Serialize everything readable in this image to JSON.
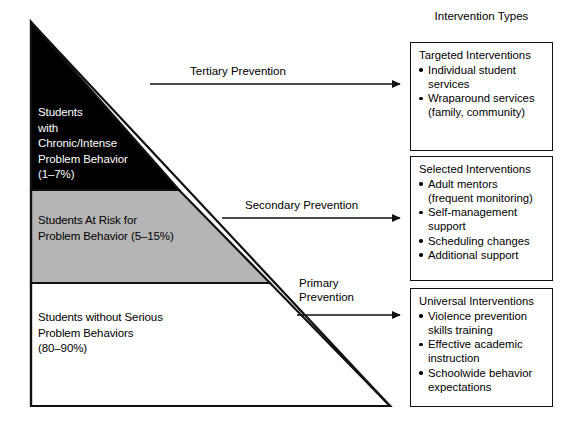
{
  "diagram": {
    "title_right_column": "Intervention Types",
    "pyramid": {
      "tiers": [
        {
          "id": "tier-chronic",
          "label": "Students\nwith\nChronic/Intense\nProblem Behavior\n(1–7%)",
          "fill": "#000000",
          "text_color": "#ffffff",
          "percent_range": "1–7%"
        },
        {
          "id": "tier-at-risk",
          "label": "Students At Risk for\nProblem Behavior (5–15%)",
          "fill": "#b5b5b5",
          "text_color": "#000000",
          "percent_range": "5–15%"
        },
        {
          "id": "tier-no-problem",
          "label": "Students without Serious\nProblem Behaviors\n(80–90%)",
          "fill": "#ffffff",
          "text_color": "#000000",
          "percent_range": "80–90%"
        }
      ]
    },
    "arrows": [
      {
        "id": "arrow-tertiary",
        "label": "Tertiary Prevention"
      },
      {
        "id": "arrow-secondary",
        "label": "Secondary Prevention"
      },
      {
        "id": "arrow-primary",
        "label": "Primary\nPrevention"
      }
    ],
    "intervention_boxes": [
      {
        "id": "box-targeted",
        "title": "Targeted Interventions",
        "items": [
          "Individual student\nservices",
          "Wraparound services\n(family, community)"
        ]
      },
      {
        "id": "box-selected",
        "title": "Selected Interventions",
        "items": [
          "Adult mentors\n(frequent monitoring)",
          "Self-management\nsupport",
          "Scheduling changes",
          "Additional support"
        ]
      },
      {
        "id": "box-universal",
        "title": "Universal Interventions",
        "items": [
          "Violence prevention\nskills training",
          "Effective academic\ninstruction",
          "Schoolwide behavior\nexpectations"
        ]
      }
    ],
    "colors": {
      "tier1_fill": "#000000",
      "tier2_fill": "#b5b5b5",
      "tier3_fill": "#ffffff",
      "stroke": "#111111"
    }
  }
}
